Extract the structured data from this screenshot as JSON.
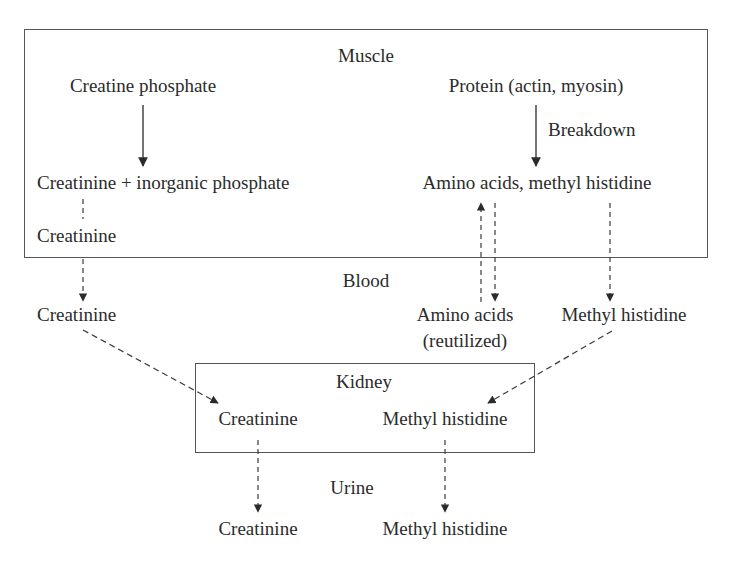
{
  "compartments": {
    "muscle": {
      "title": "Muscle",
      "nodes": {
        "creatine_phosphate": "Creatine phosphate",
        "creatinine_plus_phosphate": "Creatinine + inorganic phosphate",
        "creatinine": "Creatinine",
        "protein": "Protein (actin, myosin)",
        "breakdown_label": "Breakdown",
        "amino_acids_methyl_histidine": "Amino acids, methyl histidine"
      }
    },
    "blood": {
      "title": "Blood",
      "nodes": {
        "creatinine": "Creatinine",
        "amino_acids_line1": "Amino acids",
        "amino_acids_line2": "(reutilized)",
        "methyl_histidine": "Methyl histidine"
      }
    },
    "kidney": {
      "title": "Kidney",
      "nodes": {
        "creatinine": "Creatinine",
        "methyl_histidine": "Methyl histidine"
      }
    },
    "urine": {
      "title": "Urine",
      "nodes": {
        "creatinine": "Creatinine",
        "methyl_histidine": "Methyl histidine"
      }
    }
  },
  "edges": [
    {
      "from": "Creatine phosphate",
      "to": "Creatinine + inorganic phosphate",
      "style": "solid"
    },
    {
      "from": "Protein (actin, myosin)",
      "to": "Amino acids, methyl histidine",
      "style": "solid",
      "label": "Breakdown"
    },
    {
      "from": "Creatinine (muscle)",
      "to": "Creatinine (blood)",
      "style": "dashed"
    },
    {
      "from": "Amino acids (blood)",
      "to": "Amino acids, methyl histidine (muscle)",
      "style": "dashed"
    },
    {
      "from": "Amino acids, methyl histidine (muscle)",
      "to": "Amino acids (blood)",
      "style": "dashed"
    },
    {
      "from": "Amino acids, methyl histidine (muscle)",
      "to": "Methyl histidine (blood)",
      "style": "dashed"
    },
    {
      "from": "Creatinine (blood)",
      "to": "Creatinine (kidney)",
      "style": "dashed"
    },
    {
      "from": "Methyl histidine (blood)",
      "to": "Methyl histidine (kidney)",
      "style": "dashed"
    },
    {
      "from": "Creatinine (kidney)",
      "to": "Creatinine (urine)",
      "style": "dashed"
    },
    {
      "from": "Methyl histidine (kidney)",
      "to": "Methyl histidine (urine)",
      "style": "dashed"
    }
  ],
  "colors": {
    "line": "#3a3a3a",
    "box_border": "#555555",
    "text": "#2b2b2b",
    "background": "#ffffff"
  }
}
